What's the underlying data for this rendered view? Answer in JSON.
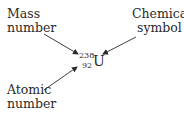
{
  "diagram": {
    "labels": {
      "mass_number": [
        "Mass",
        "number"
      ],
      "chemical_symbol": [
        "Chemical",
        "symbol"
      ],
      "atomic_number": [
        "Atomic",
        "number"
      ]
    },
    "nuclide": {
      "mass_number": "238",
      "atomic_number": "92",
      "symbol": "U"
    },
    "colors": {
      "text": "#2a2a2a",
      "arrow": "#2a2a2a",
      "background": "#ffffff"
    }
  }
}
